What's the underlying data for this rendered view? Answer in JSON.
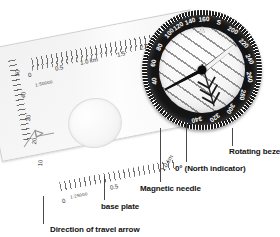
{
  "figure": {
    "style": "grayscale-photograph-with-callouts",
    "background_color": "#ffffff",
    "ink_color": "#111111"
  },
  "labels": [
    {
      "id": "rotating-bezel",
      "text": "Rotating bezel"
    },
    {
      "id": "north-indicator",
      "text": "0° (North indicator)"
    },
    {
      "id": "magnetic-needle",
      "text": "Magnetic needle"
    },
    {
      "id": "base-plate",
      "text": "base plate"
    },
    {
      "id": "travel-arrow",
      "text": "Direction of travel arrow"
    }
  ],
  "bezel": {
    "color": "#141414",
    "text_color": "#ffffff",
    "cardinal": "S",
    "degrees": [
      "100",
      "120",
      "140",
      "160",
      "S",
      "200",
      "220",
      "240",
      "260",
      "280",
      "300",
      "320",
      "340",
      "80",
      "60",
      "40"
    ],
    "ticks_per_circle": 120
  },
  "rulers": [
    {
      "id": "top-ruler",
      "scale_text": "1:50000",
      "ticks": [
        "0",
        "0.5",
        "1.0 km",
        "1.5",
        "2.0"
      ]
    },
    {
      "id": "bottom-ruler",
      "scale_text": "1:25000",
      "ticks": [
        "0",
        "0.5",
        "1.0 km"
      ]
    },
    {
      "id": "left-edge-ruler",
      "scale_text": "",
      "ticks": [
        "50",
        "40",
        "30",
        "20",
        "10"
      ]
    }
  ]
}
